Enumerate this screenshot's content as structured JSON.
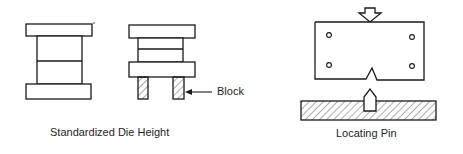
{
  "figures": [
    {
      "id": "standardized-die-height",
      "caption": "Standardized Die Height",
      "callout": "Block"
    },
    {
      "id": "locating-pin",
      "caption": "Locating Pin"
    }
  ],
  "colors": {
    "stroke": "#1a1a1a",
    "background": "#ffffff"
  }
}
